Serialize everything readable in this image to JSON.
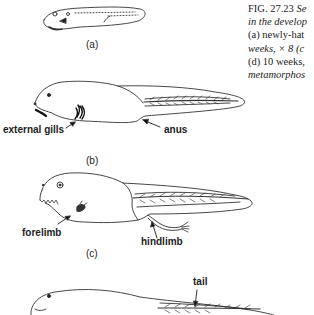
{
  "caption": {
    "figure_number": "FIG. 27.23",
    "lines": [
      "Se",
      "in the develop",
      "(a) newly-hat",
      "weeks, × 8 (c",
      "(d) 10 weeks,",
      "metamorphos"
    ]
  },
  "stages": {
    "a": "(a)",
    "b": "(b)",
    "c": "(c)"
  },
  "labels": {
    "external_gills": "external gills",
    "anus": "anus",
    "forelimb": "forelimb",
    "hindlimb": "hindlimb",
    "tail": "tail"
  }
}
